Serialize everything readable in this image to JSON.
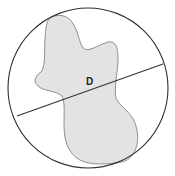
{
  "diagram": {
    "label": "D",
    "elements": [
      "circle-boundary",
      "irregular-shape",
      "diameter-line"
    ],
    "colors": {
      "stroke": "#333333",
      "shape_fill": "#e3e3e3",
      "shape_stroke": "#777777",
      "background": "#ffffff"
    }
  }
}
